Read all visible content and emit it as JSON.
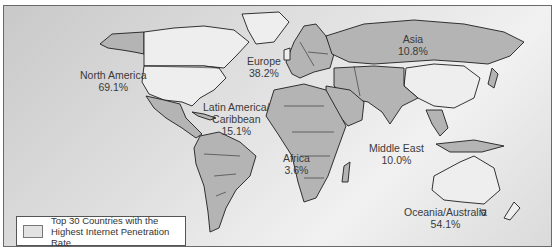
{
  "map": {
    "regions": [
      {
        "name": "North America",
        "value": "69.1%"
      },
      {
        "name": "Europe",
        "value": "38.2%"
      },
      {
        "name": "Asia",
        "value": "10.8%"
      },
      {
        "name": "Latin America/",
        "name2": "Caribbean",
        "value": "15.1%"
      },
      {
        "name": "Africa",
        "value": "3.6%"
      },
      {
        "name": "Middle East",
        "value": "10.0%"
      },
      {
        "name": "Oceania/Australia",
        "value": "54.1%"
      }
    ],
    "legend": {
      "line1": "Top 30 Countries with the",
      "line2": "Highest Internet Penetration Rate",
      "swatch_color": "#e2e2e2"
    },
    "colors": {
      "land": "#b4b4b4",
      "highlight": "#eeeeee"
    }
  }
}
